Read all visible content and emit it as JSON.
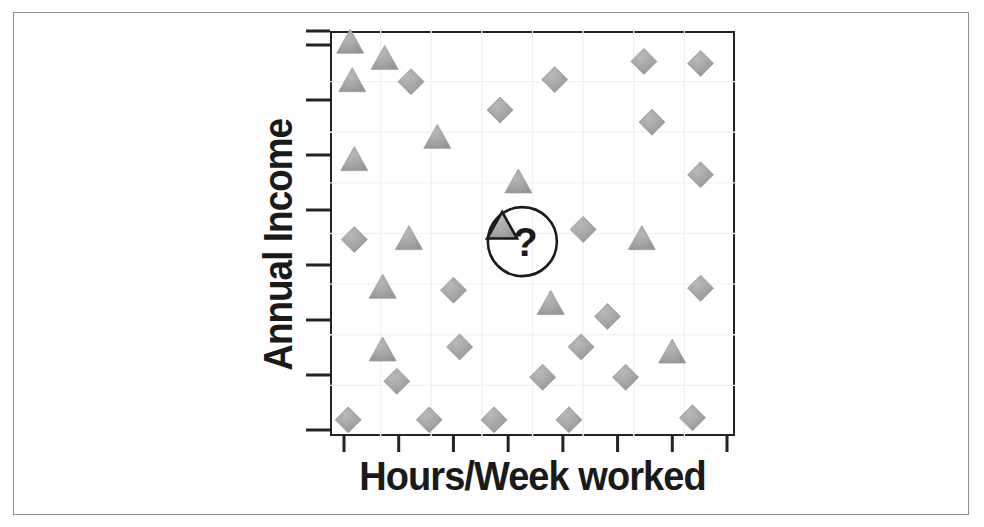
{
  "figure": {
    "kind": "scatter-plot-diagram",
    "frame_color": "#8f8f8f",
    "axis_color": "#232323",
    "marker_fill": "#a3a3a3",
    "marker_stroke": "#9a9a9a",
    "highlight_stroke": "#1a1a1a",
    "grid_color": "#f2f2f2",
    "background": "#ffffff"
  },
  "labels": {
    "y_axis_title": "Annual Income",
    "x_axis_title": "Hours/Week worked",
    "unknown_marker": "?"
  },
  "chart_data": {
    "type": "scatter",
    "title": "",
    "xlabel": "Hours/Week worked",
    "ylabel": "Annual Income",
    "xlim": [
      0,
      100
    ],
    "ylim": [
      0,
      100
    ],
    "grid": true,
    "x_tick_count": 8,
    "y_tick_count": 8,
    "x_tick_labels": [],
    "y_tick_labels": [],
    "legend_position": "none",
    "annotations": [
      {
        "text": "?",
        "x": 47.5,
        "y": 48.0,
        "shape": "circle-outline",
        "note": "unknown sample to classify, circled"
      }
    ],
    "series": [
      {
        "name": "triangle-class",
        "marker": "triangle",
        "fill": "#a3a3a3",
        "points": [
          {
            "x": 5.0,
            "y": 97.0
          },
          {
            "x": 13.5,
            "y": 93.0
          },
          {
            "x": 5.5,
            "y": 87.5
          },
          {
            "x": 26.5,
            "y": 73.5
          },
          {
            "x": 6.0,
            "y": 68.0
          },
          {
            "x": 46.5,
            "y": 62.5
          },
          {
            "x": 19.5,
            "y": 48.5
          },
          {
            "x": 13.0,
            "y": 36.5
          },
          {
            "x": 77.0,
            "y": 48.5
          },
          {
            "x": 54.5,
            "y": 32.5
          },
          {
            "x": 13.0,
            "y": 21.0
          },
          {
            "x": 84.5,
            "y": 20.5
          }
        ]
      },
      {
        "name": "diamond-class",
        "marker": "diamond",
        "fill": "#a3a3a3",
        "points": [
          {
            "x": 20.0,
            "y": 87.5
          },
          {
            "x": 55.5,
            "y": 88.0
          },
          {
            "x": 77.5,
            "y": 92.5
          },
          {
            "x": 91.5,
            "y": 92.0
          },
          {
            "x": 42.0,
            "y": 80.5
          },
          {
            "x": 79.5,
            "y": 77.5
          },
          {
            "x": 91.5,
            "y": 64.5
          },
          {
            "x": 6.0,
            "y": 48.5
          },
          {
            "x": 62.5,
            "y": 51.0
          },
          {
            "x": 30.5,
            "y": 36.0
          },
          {
            "x": 91.5,
            "y": 36.5
          },
          {
            "x": 68.5,
            "y": 29.5
          },
          {
            "x": 32.0,
            "y": 22.0
          },
          {
            "x": 62.0,
            "y": 22.0
          },
          {
            "x": 16.5,
            "y": 13.5
          },
          {
            "x": 52.5,
            "y": 14.5
          },
          {
            "x": 73.0,
            "y": 14.5
          },
          {
            "x": 4.5,
            "y": 4.0
          },
          {
            "x": 24.5,
            "y": 4.0
          },
          {
            "x": 40.5,
            "y": 4.0
          },
          {
            "x": 59.0,
            "y": 4.0
          },
          {
            "x": 89.5,
            "y": 4.5
          }
        ]
      },
      {
        "name": "unknown-sample",
        "marker": "triangle-outlined",
        "fill": "#a3a3a3",
        "points": [
          {
            "x": 42.5,
            "y": 51.5
          }
        ]
      }
    ]
  }
}
